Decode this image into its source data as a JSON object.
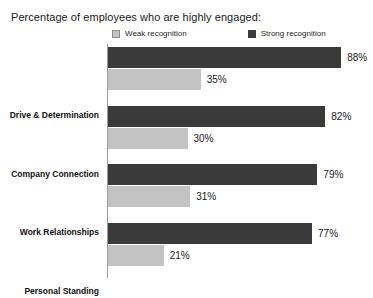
{
  "chart_data": {
    "type": "bar",
    "title": "Percentage of employees who are highly engaged:",
    "xlabel": "",
    "ylabel": "",
    "orientation": "horizontal",
    "grid": false,
    "legend_position": "top-center",
    "xlim": [
      0,
      100
    ],
    "value_suffix": "%",
    "categories": [
      "Drive & Determination",
      "Company Connection",
      "Work Relationships",
      "Personal Standing"
    ],
    "series": [
      {
        "name": "Strong recognition",
        "color": "#3a3a3a",
        "values": [
          88,
          82,
          79,
          77
        ],
        "labels": [
          "88%",
          "82%",
          "79%",
          "77%"
        ]
      },
      {
        "name": "Weak recognition",
        "color": "#c3c3c3",
        "values": [
          35,
          30,
          31,
          21
        ],
        "labels": [
          "35%",
          "30%",
          "31%",
          "21%"
        ]
      }
    ]
  },
  "legend": {
    "weak": "Weak recognition",
    "strong": "Strong recognition"
  },
  "colors": {
    "strong": "#3a3a3a",
    "weak": "#c3c3c3",
    "axis": "#9a9a9a",
    "background": "#ffffff",
    "text": "#1a1a1a"
  }
}
